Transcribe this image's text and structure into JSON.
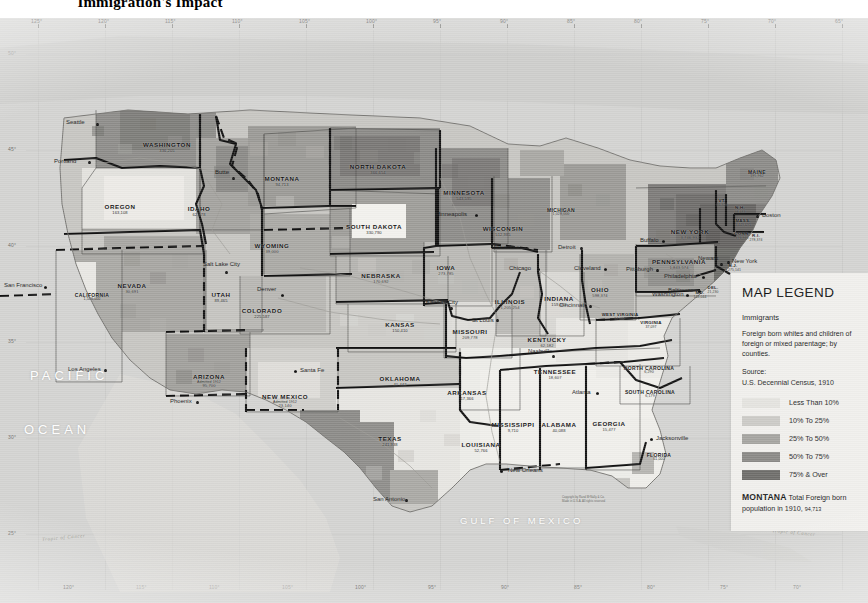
{
  "title": "Immigration's Impact",
  "map": {
    "projection_note": "United States, counties shaded by percent foreign born",
    "ocean_labels": [
      {
        "text": "PACIFIC",
        "x": 30,
        "y": 358
      },
      {
        "text": "OCEAN",
        "x": 24,
        "y": 412
      }
    ],
    "gulf_label": {
      "text": "GULF OF MEXICO",
      "x": 462,
      "y": 505
    },
    "tropic_labels": [
      {
        "text": "Tropic of Cancer",
        "x": 44,
        "y": 522
      },
      {
        "text": "Tropic of Cancer",
        "x": 775,
        "y": 518
      }
    ],
    "copyright": [
      "Copyright by Rand MᶜNally & Co.",
      "Made in U.S.A.   All rights reserved"
    ],
    "longitude_top": [
      "125°",
      "120°",
      "115°",
      "110°",
      "105°",
      "100°",
      "95°",
      "90°",
      "85°",
      "80°",
      "75°",
      "70°",
      "65°"
    ],
    "longitude_bottom": [
      "120°",
      "115°",
      "110°",
      "105°",
      "100°",
      "95°",
      "90°",
      "85°",
      "80°",
      "75°",
      "70°"
    ],
    "latitude_left": [
      "50°",
      "45°",
      "40°",
      "35°",
      "30°",
      "25°"
    ]
  },
  "legend": {
    "heading": "MAP LEGEND",
    "subject": "Immigrants",
    "description": "Foreign born whites and children of foreign or mixed parentage; by counties.",
    "source_label": "Source:",
    "source_value": "U.S. Decennial Census, 1910",
    "classes": [
      {
        "label": "Less Than 10%",
        "color": "#e4e3df"
      },
      {
        "label": "10% To 25%",
        "color": "#cbcac6"
      },
      {
        "label": "25% To 50%",
        "color": "#a5a4a0"
      },
      {
        "label": "50% To 75%",
        "color": "#8a8986"
      },
      {
        "label": "75% & Over",
        "color": "#6e6d6a"
      }
    ],
    "footnote_state": "MONTANA",
    "footnote_text": "Total Foreign born population in 1910,",
    "footnote_number": "94,713"
  },
  "states": [
    {
      "name": "WASHINGTON",
      "pop": "336,205",
      "x": 167,
      "y": 124,
      "cls": ""
    },
    {
      "name": "OREGON",
      "pop": "163,108",
      "x": 120,
      "y": 186,
      "cls": ""
    },
    {
      "name": "IDAHO",
      "pop": "62,578",
      "x": 199,
      "y": 188,
      "cls": ""
    },
    {
      "name": "MONTANA",
      "pop": "94,713",
      "x": 282,
      "y": 158,
      "cls": ""
    },
    {
      "name": "WYOMING",
      "pop": "39,000",
      "x": 272,
      "y": 225,
      "cls": ""
    },
    {
      "name": "NEVADA",
      "pop": "30,691",
      "x": 132,
      "y": 265,
      "cls": ""
    },
    {
      "name": "UTAH",
      "pop": "89,465",
      "x": 221,
      "y": 274,
      "cls": ""
    },
    {
      "name": "COLORADO",
      "pop": "225,587",
      "x": 262,
      "y": 290,
      "cls": ""
    },
    {
      "name": "ARIZONA",
      "pop": "95,700",
      "x": 209,
      "y": 356,
      "admitted": "Admitted 1912",
      "cls": ""
    },
    {
      "name": "NEW MEXICO",
      "pop": "23,140",
      "x": 285,
      "y": 376,
      "admitted": "Admitted 1912",
      "cls": ""
    },
    {
      "name": "NORTH DAKOTA",
      "pop": "366,654",
      "x": 378,
      "y": 146,
      "cls": ""
    },
    {
      "name": "SOUTH DAKOTA",
      "pop": "330,790",
      "x": 374,
      "y": 206,
      "cls": ""
    },
    {
      "name": "NEBRASKA",
      "pop": "170,692",
      "x": 381,
      "y": 255,
      "cls": ""
    },
    {
      "name": "KANSAS",
      "pop": "150,410",
      "x": 400,
      "y": 304,
      "cls": ""
    },
    {
      "name": "MINNESOTA",
      "pop": "543,595",
      "x": 464,
      "y": 172,
      "cls": ""
    },
    {
      "name": "IOWA",
      "pop": "273,785",
      "x": 446,
      "y": 247,
      "cls": ""
    },
    {
      "name": "MISSOURI",
      "pop": "209,778",
      "x": 470,
      "y": 311,
      "cls": ""
    },
    {
      "name": "WISCONSIN",
      "pop": "512,985",
      "x": 503,
      "y": 208,
      "cls": ""
    },
    {
      "name": "ILLINOIS",
      "pop": "1,205,254",
      "x": 510,
      "y": 281,
      "cls": ""
    },
    {
      "name": "INDIANA",
      "pop": "159,663",
      "x": 559,
      "y": 278,
      "cls": ""
    },
    {
      "name": "OHIO",
      "pop": "598,374",
      "x": 600,
      "y": 269,
      "cls": ""
    },
    {
      "name": "KENTUCKY",
      "pop": "62,182",
      "x": 547,
      "y": 319,
      "cls": ""
    },
    {
      "name": "OKLAHOMA",
      "pop": "40,442",
      "x": 400,
      "y": 358,
      "cls": ""
    },
    {
      "name": "ARKANSAS",
      "pop": "17,366",
      "x": 467,
      "y": 372,
      "cls": ""
    },
    {
      "name": "TEXAS",
      "pop": "241,938",
      "x": 390,
      "y": 418,
      "cls": ""
    },
    {
      "name": "LOUISIANA",
      "pop": "52,766",
      "x": 481,
      "y": 424,
      "cls": ""
    },
    {
      "name": "MISSISSIPPI",
      "pop": "9,710",
      "x": 513,
      "y": 404,
      "cls": ""
    },
    {
      "name": "ALABAMA",
      "pop": "40,088",
      "x": 559,
      "y": 404,
      "cls": ""
    },
    {
      "name": "GEORGIA",
      "pop": "15,477",
      "x": 609,
      "y": 403,
      "cls": ""
    },
    {
      "name": "TENNESSEE",
      "pop": "18,607",
      "x": 555,
      "y": 351,
      "cls": ""
    },
    {
      "name": "NORTH CAROLINA",
      "pop": "6,290",
      "x": 649,
      "y": 348,
      "cls": "sm"
    },
    {
      "name": "SOUTH CAROLINA",
      "pop": "6,179",
      "x": 650,
      "y": 372,
      "cls": "sm"
    },
    {
      "name": "WEST VIRGINIA",
      "pop": "57,097",
      "x": 620,
      "y": 295,
      "cls": "xs"
    },
    {
      "name": "VIRGINIA",
      "pop": "37,097",
      "x": 651,
      "y": 303,
      "cls": "xs"
    },
    {
      "name": "PENNSYLVANIA",
      "pop": "1,843,574",
      "x": 679,
      "y": 241,
      "cls": ""
    },
    {
      "name": "NEW YORK",
      "pop": "3,746,932",
      "x": 690,
      "y": 211,
      "cls": ""
    },
    {
      "name": "MAINE",
      "pop": "195,962",
      "x": 757,
      "y": 152,
      "cls": "sm"
    },
    {
      "name": "VT.",
      "pop": "86,920",
      "x": 722,
      "y": 181,
      "cls": "xs"
    },
    {
      "name": "N.H.",
      "pop": "98,483",
      "x": 740,
      "y": 188,
      "cls": "xs"
    },
    {
      "name": "MASS.",
      "pop": "1,449,695",
      "x": 743,
      "y": 201,
      "cls": "xs"
    },
    {
      "name": "CONN.",
      "pop": "376,946",
      "x": 742,
      "y": 214,
      "cls": "xs"
    },
    {
      "name": "R.I.",
      "pop": "278,374",
      "x": 756,
      "y": 216,
      "cls": "xs"
    },
    {
      "name": "N.J.",
      "pop": "1,275,141",
      "x": 733,
      "y": 246,
      "cls": "xs"
    },
    {
      "name": "DEL.",
      "pop": "21,230",
      "x": 713,
      "y": 268,
      "cls": "xs"
    },
    {
      "name": "MD.",
      "pop": "148,044",
      "x": 700,
      "y": 273,
      "cls": "xs"
    },
    {
      "name": "FLORIDA",
      "pop": "61,000",
      "x": 659,
      "y": 435,
      "cls": "sm"
    },
    {
      "name": "MICHIGAN",
      "pop": "1,028,000",
      "x": 561,
      "y": 190,
      "cls": "sm"
    },
    {
      "name": "CALIFORNIA",
      "pop": "1,586,000",
      "x": 92,
      "y": 275,
      "cls": "sm"
    }
  ],
  "cities": [
    {
      "name": "Seattle",
      "x": 96,
      "y": 105,
      "lx": -30,
      "ly": -4
    },
    {
      "name": "Portland",
      "x": 88,
      "y": 143,
      "lx": -34,
      "ly": -3
    },
    {
      "name": "San Francisco",
      "x": 44,
      "y": 268,
      "lx": -40,
      "ly": -4
    },
    {
      "name": "Los Angeles",
      "x": 104,
      "y": 351,
      "lx": -36,
      "ly": -3
    },
    {
      "name": "Butte",
      "x": 232,
      "y": 159,
      "lx": -17,
      "ly": -8
    },
    {
      "name": "Salt Lake City",
      "x": 225,
      "y": 253,
      "lx": -22,
      "ly": -10
    },
    {
      "name": "Denver",
      "x": 281,
      "y": 276,
      "lx": -24,
      "ly": -8
    },
    {
      "name": "Phoenix",
      "x": 196,
      "y": 383,
      "lx": -26,
      "ly": -3
    },
    {
      "name": "Santa Fe",
      "x": 294,
      "y": 352,
      "lx": 6,
      "ly": -3
    },
    {
      "name": "San Antonio",
      "x": 405,
      "y": 481,
      "lx": -32,
      "ly": -3
    },
    {
      "name": "Kansas City",
      "x": 450,
      "y": 289,
      "lx": -24,
      "ly": -8
    },
    {
      "name": "St Louis",
      "x": 496,
      "y": 301,
      "lx": -24,
      "ly": -2
    },
    {
      "name": "Minneapolis",
      "x": 475,
      "y": 196,
      "lx": -40,
      "ly": -3
    },
    {
      "name": "Milwaukee",
      "x": 525,
      "y": 229,
      "lx": -34,
      "ly": -3
    },
    {
      "name": "Chicago",
      "x": 537,
      "y": 250,
      "lx": -28,
      "ly": -3
    },
    {
      "name": "Detroit",
      "x": 580,
      "y": 229,
      "lx": -22,
      "ly": -3
    },
    {
      "name": "Cleveland",
      "x": 604,
      "y": 250,
      "lx": -30,
      "ly": -3
    },
    {
      "name": "Cincinnati",
      "x": 589,
      "y": 287,
      "lx": -30,
      "ly": -3
    },
    {
      "name": "Buffalo",
      "x": 662,
      "y": 222,
      "lx": -22,
      "ly": -3
    },
    {
      "name": "Pittsburgh",
      "x": 656,
      "y": 251,
      "lx": -30,
      "ly": -3
    },
    {
      "name": "Philadelphia",
      "x": 702,
      "y": 258,
      "lx": -38,
      "ly": -3
    },
    {
      "name": "Baltimore",
      "x": 698,
      "y": 272,
      "lx": -30,
      "ly": -3
    },
    {
      "name": "Washington",
      "x": 686,
      "y": 276,
      "lx": -34,
      "ly": -3
    },
    {
      "name": "New York",
      "x": 727,
      "y": 243,
      "lx": 5,
      "ly": -3
    },
    {
      "name": "Newark",
      "x": 720,
      "y": 245,
      "lx": -22,
      "ly": -8
    },
    {
      "name": "Boston",
      "x": 756,
      "y": 197,
      "lx": 6,
      "ly": -3
    },
    {
      "name": "Nashville",
      "x": 552,
      "y": 337,
      "lx": -24,
      "ly": -7
    },
    {
      "name": "Atlanta",
      "x": 596,
      "y": 374,
      "lx": -24,
      "ly": -3
    },
    {
      "name": "Jacksonville",
      "x": 650,
      "y": 420,
      "lx": 6,
      "ly": -3
    },
    {
      "name": "New Orleans",
      "x": 500,
      "y": 452,
      "lx": 8,
      "ly": -3
    }
  ]
}
